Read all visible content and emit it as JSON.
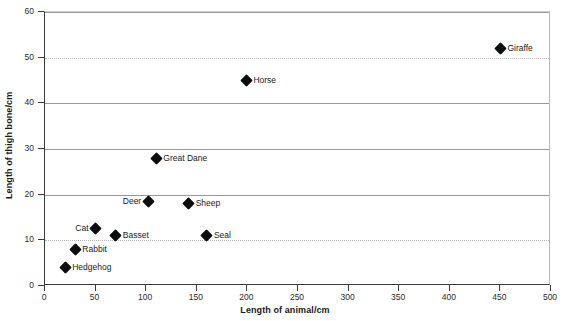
{
  "chart_data": {
    "type": "scatter",
    "title": "",
    "xlabel": "Length of animal/cm",
    "ylabel": "Length of thigh bone/cm",
    "xlim": [
      0,
      500
    ],
    "ylim": [
      0,
      60
    ],
    "xticks": [
      0,
      50,
      100,
      150,
      200,
      250,
      300,
      350,
      400,
      450,
      500
    ],
    "yticks": [
      0,
      10,
      20,
      30,
      40,
      50,
      60
    ],
    "grid": "horizontal",
    "legend": "none",
    "marker": "black-diamond",
    "points": [
      {
        "label": "Hedgehog",
        "x": 20,
        "y": 4,
        "label_side": "right"
      },
      {
        "label": "Rabbit",
        "x": 30,
        "y": 8,
        "label_side": "right"
      },
      {
        "label": "Cat",
        "x": 50,
        "y": 12.5,
        "label_side": "left"
      },
      {
        "label": "Basset",
        "x": 70,
        "y": 11,
        "label_side": "right"
      },
      {
        "label": "Deer",
        "x": 102,
        "y": 18.5,
        "label_side": "left"
      },
      {
        "label": "Great Dane",
        "x": 110,
        "y": 28,
        "label_side": "right"
      },
      {
        "label": "Sheep",
        "x": 142,
        "y": 18,
        "label_side": "right"
      },
      {
        "label": "Seal",
        "x": 160,
        "y": 11,
        "label_side": "right"
      },
      {
        "label": "Horse",
        "x": 199,
        "y": 45,
        "label_side": "right"
      },
      {
        "label": "Giraffe",
        "x": 450,
        "y": 52,
        "label_side": "right"
      }
    ]
  }
}
